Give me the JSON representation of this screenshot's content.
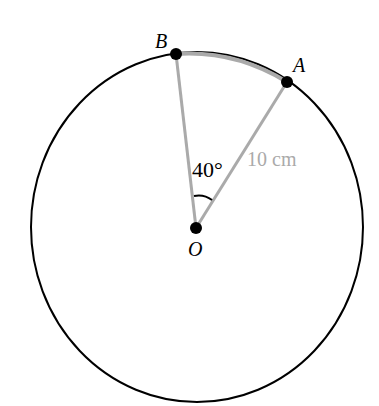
{
  "diagram": {
    "type": "circle-sector",
    "circle": {
      "cx": 197,
      "cy": 227,
      "rx": 166,
      "ry": 175,
      "stroke": "#000000"
    },
    "points": {
      "O": {
        "label": "O",
        "x": 196,
        "y": 228
      },
      "A": {
        "label": "A",
        "x": 287,
        "y": 82
      },
      "B": {
        "label": "B",
        "x": 176,
        "y": 54
      }
    },
    "angle_label": "40°",
    "radius_label": "10 cm",
    "sector_color": "#aaaaaa",
    "point_color": "#000000"
  }
}
